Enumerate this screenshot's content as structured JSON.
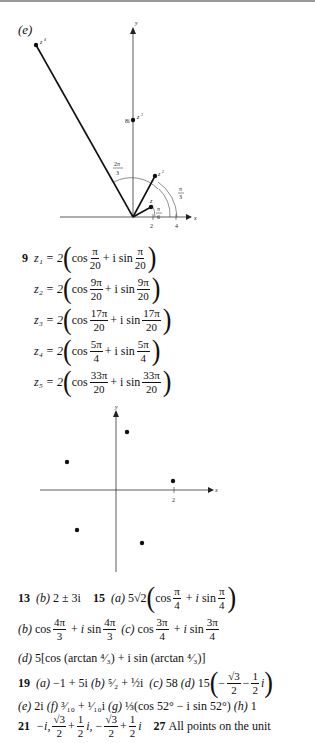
{
  "figure_e": {
    "label": "(e)",
    "axis_x": "x",
    "axis_y": "y",
    "points": [
      "z",
      "z²",
      "z³",
      "z⁴"
    ],
    "label_8i": "8i",
    "angle_2pi3": {
      "num": "2π",
      "den": "3"
    },
    "angle_pi3": {
      "num": "π",
      "den": "3"
    },
    "angle_pi6": {
      "num": "π",
      "den": "6"
    },
    "tick_2": "2",
    "tick_4": "4"
  },
  "problem9": {
    "number": "9",
    "lines": [
      {
        "lhs": "z₁ = 2",
        "num": "π",
        "den": "20"
      },
      {
        "lhs": "z₂ = 2",
        "num": "9π",
        "den": "20"
      },
      {
        "lhs": "z₃ = 2",
        "num": "17π",
        "den": "20"
      },
      {
        "lhs": "z₄ = 2",
        "num": "5π",
        "den": "4"
      },
      {
        "lhs": "z₅ = 2",
        "num": "33π",
        "den": "20"
      }
    ],
    "cos": "cos",
    "plus_i_sin": "+ i sin"
  },
  "figure9": {
    "axis_x": "x",
    "axis_y": "y",
    "tick_2": "2"
  },
  "answers": {
    "a13": {
      "num": "13",
      "part": "(b)",
      "text": "2 ± 3i"
    },
    "a15": {
      "num": "15",
      "a_part": "(a)",
      "a_coef": "5√2",
      "a_num": "π",
      "a_den": "4",
      "b_part": "(b)",
      "b_num": "4π",
      "b_den": "3",
      "c_part": "(c)",
      "c_num": "3π",
      "c_den": "4",
      "d_part": "(d)",
      "d_text": "5[cos (arctan ⁴⁄₃) + i sin (arctan ⁴⁄₃)]"
    },
    "a19": {
      "num": "19",
      "a_part": "(a)",
      "a_text": "−1 + 5i",
      "b_part": "(b)",
      "b_text": "⁵⁄₂ + ½i",
      "c_part": "(c)",
      "c_text": "58",
      "d_part": "(d)",
      "d_coef": "15",
      "d_num1": "√3",
      "d_den1": "2",
      "d_num2": "1",
      "d_den2": "2",
      "e_part": "(e)",
      "e_text": "2i",
      "f_part": "(f)",
      "f_text": "³⁄₁₀ + ¹⁄₁₀i",
      "g_part": "(g)",
      "g_text": "⅓(cos 52° − i sin 52°)",
      "h_part": "(h)",
      "h_text": "1"
    },
    "a21": {
      "num": "21",
      "text1": "−i,",
      "n1": "√3",
      "d1": "2",
      "n2": "1",
      "d2": "2",
      "sep": "i,",
      "minus": "−",
      "n3": "√3",
      "d3": "2",
      "n4": "1",
      "d4": "2",
      "tail": "i"
    },
    "a27": {
      "num": "27",
      "text": "All points on the unit"
    }
  }
}
